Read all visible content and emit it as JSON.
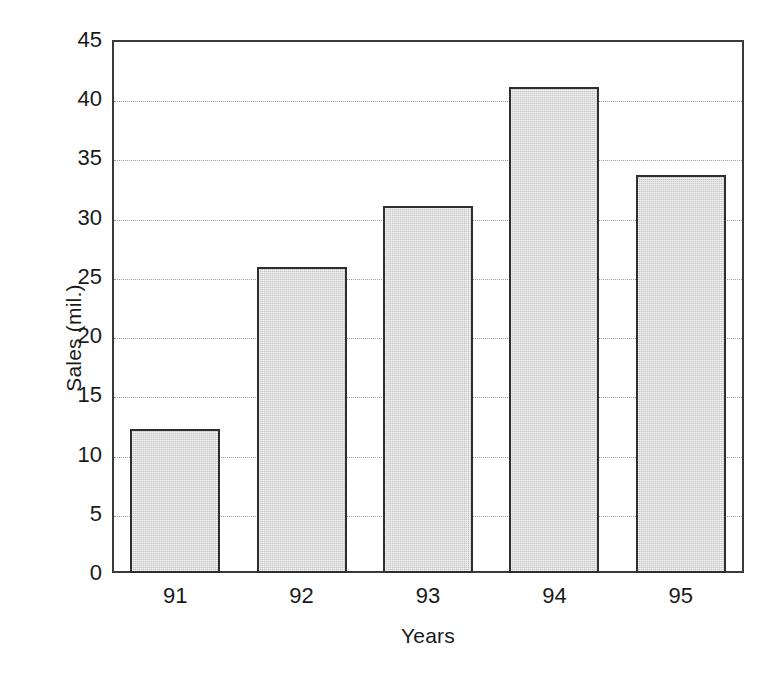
{
  "chart_data": {
    "type": "bar",
    "title": "",
    "subtitle": "",
    "xlabel": "Years",
    "ylabel": "Sales (mil.)",
    "categories": [
      "91",
      "92",
      "93",
      "94",
      "95"
    ],
    "values": [
      12.2,
      25.8,
      31.0,
      41.0,
      33.6
    ],
    "series": [
      {
        "name": "Sales",
        "values": [
          12.2,
          25.8,
          31.0,
          41.0,
          33.6
        ]
      }
    ],
    "ylim": [
      0,
      45
    ],
    "ytick_labels": [
      "0",
      "5",
      "10",
      "15",
      "20",
      "25",
      "30",
      "35",
      "40",
      "45"
    ],
    "ytick_values": [
      0,
      5,
      10,
      15,
      20,
      25,
      30,
      35,
      40,
      45
    ],
    "xtick_labels": [
      "91",
      "92",
      "93",
      "94",
      "95"
    ],
    "grid": {
      "horizontal": true,
      "vertical": false,
      "style": "dotted",
      "color": "#9a9a9a"
    },
    "legend": {
      "visible": false,
      "position": "none",
      "entries": []
    },
    "annotations": [],
    "colors": {
      "bar_fill": "#c6c6c6",
      "bar_border": "#2e2e2e",
      "axis": "#3a3a3a",
      "grid": "#9a9a9a",
      "text": "#1a1a1a",
      "background": "#ffffff"
    }
  }
}
